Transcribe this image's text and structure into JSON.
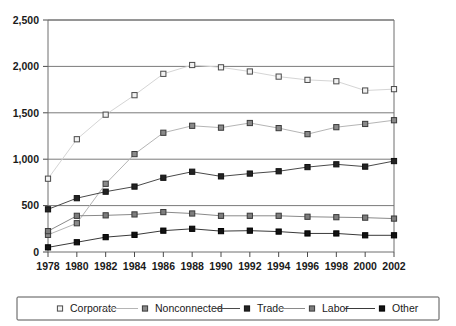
{
  "chart_data": {
    "type": "line",
    "title": "",
    "subtitle": "",
    "xlabel": "",
    "ylabel": "",
    "x": [
      1978,
      1980,
      1982,
      1984,
      1986,
      1988,
      1990,
      1992,
      1994,
      1996,
      1998,
      2000,
      2002
    ],
    "categories": [
      "1978",
      "1980",
      "1982",
      "1984",
      "1986",
      "1988",
      "1990",
      "1992",
      "1994",
      "1996",
      "1998",
      "2000",
      "2002"
    ],
    "xlim": [
      1978,
      2002
    ],
    "ylim": [
      0,
      2500
    ],
    "ytick_values": [
      0,
      500,
      1000,
      1500,
      2000,
      2500
    ],
    "ytick_labels": [
      "0",
      "500",
      "1,000",
      "1,500",
      "2,000",
      "2,500"
    ],
    "grid": "horizontal",
    "legend_position": "bottom",
    "series": [
      {
        "name": "Corporate",
        "marker": "open-square",
        "fill": "#f2f2f2",
        "stroke": "#4a4a4a",
        "line_color": "#d5d5d5",
        "values": [
          790,
          1215,
          1480,
          1690,
          1920,
          2015,
          1990,
          1945,
          1890,
          1855,
          1840,
          1740,
          1755
        ]
      },
      {
        "name": "Nonconnected",
        "marker": "filled-square",
        "fill": "#8a8a8a",
        "stroke": "#3a3a3a",
        "line_color": "#b5b5b5",
        "values": [
          185,
          310,
          735,
          1055,
          1285,
          1360,
          1340,
          1390,
          1335,
          1270,
          1345,
          1380,
          1420
        ]
      },
      {
        "name": "Trade",
        "marker": "filled-square",
        "fill": "#232323",
        "stroke": "#111111",
        "line_color": "#4a4a4a",
        "values": [
          460,
          580,
          650,
          705,
          800,
          865,
          815,
          845,
          870,
          915,
          945,
          920,
          980
        ]
      },
      {
        "name": "Labor",
        "marker": "filled-square",
        "fill": "#7d7d7d",
        "stroke": "#3a3a3a",
        "line_color": "#8a8a8a",
        "values": [
          225,
          390,
          395,
          405,
          430,
          415,
          390,
          390,
          390,
          380,
          375,
          370,
          360
        ]
      },
      {
        "name": "Other",
        "marker": "filled-square",
        "fill": "#121212",
        "stroke": "#000000",
        "line_color": "#3a3a3a",
        "values": [
          50,
          105,
          160,
          185,
          230,
          250,
          225,
          230,
          220,
          200,
          200,
          180,
          180
        ]
      }
    ]
  }
}
